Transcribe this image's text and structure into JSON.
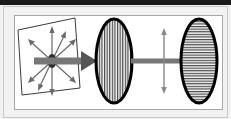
{
  "figure": {
    "kind": "diagram",
    "title": "",
    "caption": "",
    "background_color": "#f2f2f2",
    "panel_color": "#ffffff",
    "frame": {
      "top_bar_color": "#1a1a1a",
      "outer_border_color": "#c9c9c9",
      "inner_border_color": "#b0b0b0",
      "panel_border_color": "#a8a8a8"
    }
  },
  "palette": {
    "beam_shaft": "#777777",
    "beam_head": "#555555",
    "ray_arrow": "#6b6b6b",
    "ellipse_outline": "#000000",
    "ellipse_fill": "#f5f5f5",
    "hatch_line": "#3d3d3d",
    "plane_outline": "#3a3a3a",
    "source_dot": "#2e2e2e",
    "polarization_arrow": "#8a8a8a"
  },
  "elements": {
    "source_plane": {
      "name": "unpolarized-light-plane",
      "shape": "parallelogram",
      "points": "22,95 18,30 75,18 80,88",
      "stroke_width": 1
    },
    "source_dot": {
      "name": "light-source-point",
      "cx": 52,
      "cy": 61,
      "rx": 4.5,
      "ry": 7
    },
    "radiating_rays": {
      "name": "unpolarized-vibration-rays",
      "count": 8,
      "length": 29,
      "angles_deg": [
        90,
        45,
        0,
        315,
        270,
        225,
        180,
        135
      ],
      "head_size": 3.6,
      "note": "double-headed arrows in all transverse directions"
    },
    "beam_segment_1": {
      "name": "incident-beam",
      "x1": 34,
      "x2": 97,
      "y": 61,
      "thickness": 7,
      "head_length": 16,
      "head_half_width": 10
    },
    "beam_segment_2": {
      "name": "polarized-beam",
      "x1": 131,
      "x2": 196,
      "y": 61,
      "thickness": 5,
      "head_length": 14,
      "head_half_width": 8
    },
    "polarizer": {
      "name": "vertical-polarizer",
      "cx": 114,
      "cy": 61,
      "rx": 18,
      "ry": 42,
      "hatch": "vertical",
      "hatch_spacing": 2.6,
      "outline_width": 3
    },
    "analyzer": {
      "name": "horizontal-analyzer",
      "cx": 199,
      "cy": 61,
      "rx": 18,
      "ry": 42,
      "hatch": "horizontal",
      "hatch_spacing": 2.6,
      "outline_width": 3
    },
    "polarization_indicator": {
      "name": "vertical-polarization-arrow",
      "x": 164,
      "y1": 29,
      "y2": 93,
      "thickness": 1.4,
      "head_size": 4
    }
  },
  "labels": {
    "has_text": false,
    "items": []
  }
}
